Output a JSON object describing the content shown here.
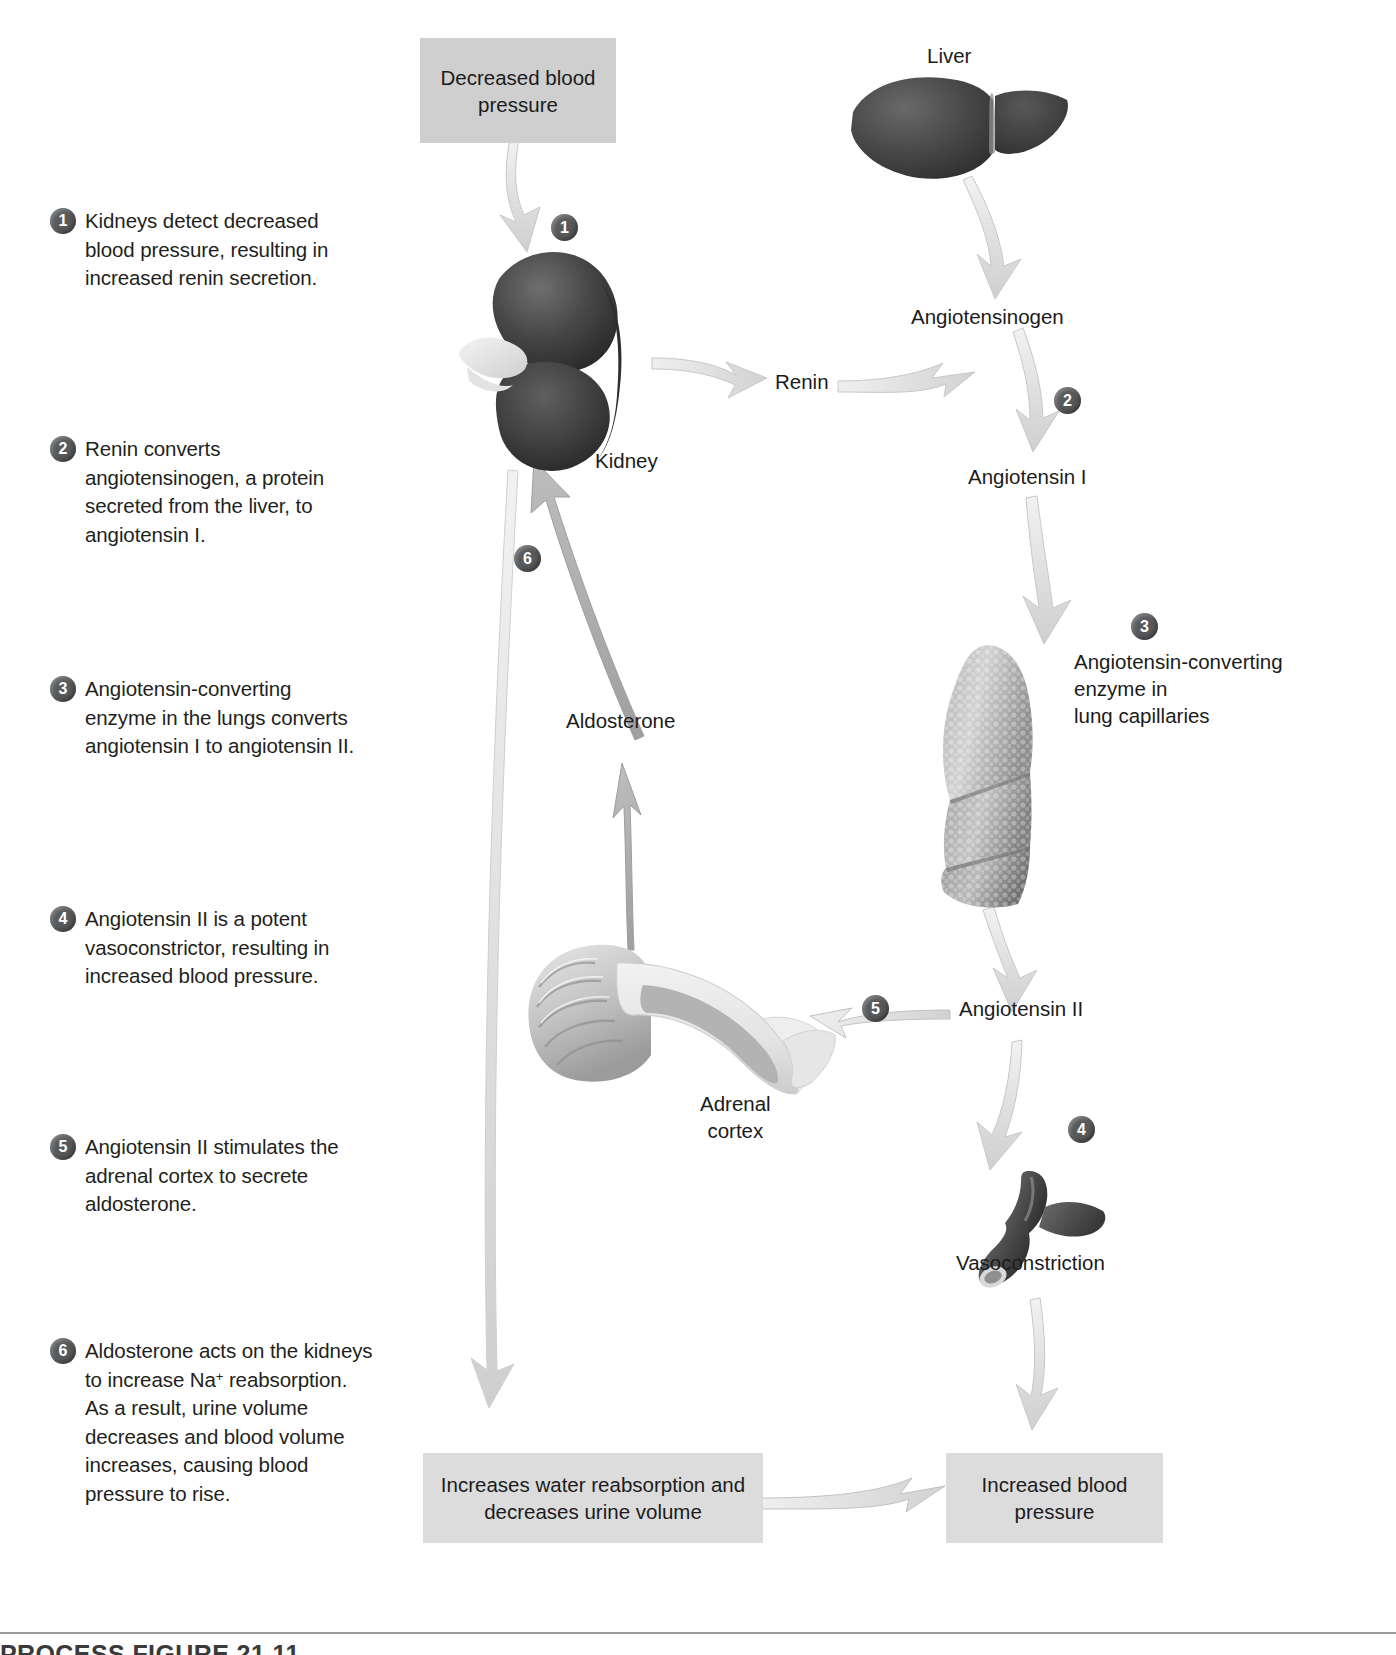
{
  "figure": {
    "title_partial": "PROCESS FIGURE 21.11",
    "domain": "renin-angiotensin-aldosterone system flow diagram"
  },
  "steps": [
    {
      "number": "1",
      "text": "Kidneys detect decreased blood pressure, resulting in increased renin secretion."
    },
    {
      "number": "2",
      "text": "Renin converts angiotensinogen, a protein secreted from the liver, to angiotensin I."
    },
    {
      "number": "3",
      "text": "Angiotensin-converting enzyme in the lungs converts angiotensin I to angiotensin II."
    },
    {
      "number": "4",
      "text": "Angiotensin II is a potent vasoconstrictor, resulting in increased blood pressure."
    },
    {
      "number": "5",
      "text": "Angiotensin II stimulates the adrenal cortex to secrete aldosterone."
    },
    {
      "number": "6a",
      "text": "Aldosterone acts on the kidneys to increase Na",
      "sup": "+",
      "text2": " reabsorption. As a result, urine volume decreases and blood volume increases, causing blood pressure to rise."
    }
  ],
  "boxes": {
    "decreased_bp": "Decreased\nblood pressure",
    "increases_water": "Increases water reabsorption\nand decreases urine volume",
    "increased_bp": "Increased\nblood pressure"
  },
  "labels": {
    "liver": "Liver",
    "kidney": "Kidney",
    "renin": "Renin",
    "angiotensinogen": "Angiotensinogen",
    "angiotensin_i": "Angiotensin I",
    "ace_lung": "Angiotensin-converting\nenzyme in\nlung capillaries",
    "angiotensin_ii": "Angiotensin II",
    "aldosterone": "Aldosterone",
    "adrenal_cortex": "Adrenal\ncortex",
    "vasoconstriction": "Vasoconstriction"
  },
  "diagram_numbers": {
    "n1": "1",
    "n2": "2",
    "n3": "3",
    "n4": "4",
    "n5": "5",
    "n6": "6"
  },
  "colors": {
    "box_fill": "#cfcfcf",
    "badge_fill": "#58595b",
    "arrow_light": "#e4e4e4",
    "arrow_mid": "#b7b7b7",
    "organ_dark": "#3b3b3b",
    "organ_light": "#c9c9c9",
    "text": "#1b1b1b"
  }
}
